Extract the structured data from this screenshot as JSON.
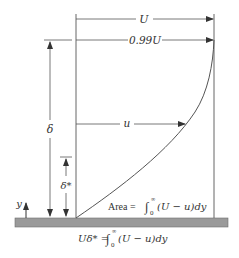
{
  "diagram": {
    "labels": {
      "free_stream": "U",
      "edge_velocity": "0.99U",
      "local_velocity": "u",
      "thickness": "δ",
      "displacement_thickness": "δ*",
      "y_axis": "y",
      "area_prefix": "Area = ",
      "area_integrand": "(U − u)dy",
      "equation_lhs": "Uδ* = ",
      "equation_integrand": "(U − u)dy",
      "integral_sign": "∫",
      "upper_limit": "∞",
      "lower_limit": "0"
    },
    "colors": {
      "line": "#555555",
      "plate": "#9a9a9a",
      "plate_edge": "#6e6e6e",
      "text": "#333333"
    }
  }
}
